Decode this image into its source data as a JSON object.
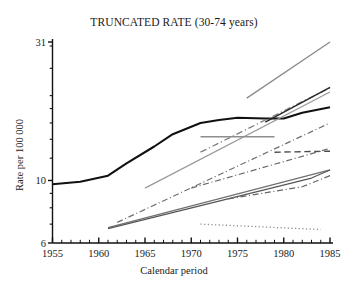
{
  "chart_data": {
    "type": "line",
    "title": "TRUNCATED RATE (30-74 years)",
    "xlabel": "Calendar period",
    "ylabel": "Rate per 100 000",
    "yscale": "log",
    "ylim": [
      6,
      31
    ],
    "xlim": [
      1955,
      1985
    ],
    "ytick_labels": [
      "31",
      "10",
      "6"
    ],
    "ytick_values": [
      31,
      10,
      6
    ],
    "xtick_labels": [
      "1955",
      "1960",
      "1965",
      "1970",
      "1975",
      "1980",
      "1985"
    ],
    "xtick_values": [
      1955,
      1960,
      1965,
      1970,
      1975,
      1980,
      1985
    ],
    "xminor_step": 1,
    "grid": false,
    "legend": "none",
    "series": [
      {
        "name": "series-1-thick-solid-black",
        "style": "solid",
        "color": "#111111",
        "width": 2.1,
        "x": [
          1955,
          1958,
          1961,
          1963,
          1966,
          1968,
          1971,
          1973,
          1975,
          1978,
          1980,
          1982,
          1985
        ],
        "y": [
          9.7,
          9.9,
          10.4,
          11.5,
          13.2,
          14.6,
          16.0,
          16.4,
          16.7,
          16.6,
          16.6,
          17.4,
          18.2
        ]
      },
      {
        "name": "series-2-steep-gray-solid",
        "style": "solid",
        "color": "#8a8a8a",
        "width": 1.3,
        "x": [
          1976,
          1985
        ],
        "y": [
          19.6,
          31.0
        ]
      },
      {
        "name": "series-3-gray-dashdot-rising",
        "style": "dashdot",
        "color": "#7d7d7d",
        "width": 1.3,
        "x": [
          1971,
          1985
        ],
        "y": [
          12.6,
          21.3
        ]
      },
      {
        "name": "series-4-gray-solid-rising",
        "style": "solid",
        "color": "#9a9a9a",
        "width": 1.3,
        "x": [
          1965,
          1985
        ],
        "y": [
          9.4,
          20.6
        ]
      },
      {
        "name": "series-5-black-solid-rising-right",
        "style": "solid",
        "color": "#2a2a2a",
        "width": 1.5,
        "x": [
          1978,
          1985
        ],
        "y": [
          16.1,
          21.4
        ]
      },
      {
        "name": "series-6-gray-horizontal",
        "style": "solid",
        "color": "#8e8e8e",
        "width": 1.5,
        "x": [
          1971,
          1979
        ],
        "y": [
          14.3,
          14.3
        ]
      },
      {
        "name": "series-7-dashdot-long-rise",
        "style": "dashdot",
        "color": "#6f6f6f",
        "width": 1.2,
        "x": [
          1962,
          1985
        ],
        "y": [
          7.1,
          16.0
        ]
      },
      {
        "name": "series-8-dashed-plateau",
        "style": "dashed",
        "color": "#4a4a4a",
        "width": 1.4,
        "x": [
          1979,
          1985
        ],
        "y": [
          12.6,
          12.7
        ]
      },
      {
        "name": "series-9-dashdot-mid-rise",
        "style": "dashdot",
        "color": "#6a6a6a",
        "width": 1.2,
        "x": [
          1970,
          1985
        ],
        "y": [
          9.4,
          13.0
        ]
      },
      {
        "name": "series-10-solid-low-rise",
        "style": "solid",
        "color": "#707070",
        "width": 1.2,
        "x": [
          1961,
          1985
        ],
        "y": [
          6.8,
          10.9
        ]
      },
      {
        "name": "series-11-solid-low-rise-b",
        "style": "solid",
        "color": "#555555",
        "width": 1.2,
        "x": [
          1961,
          1983,
          1985
        ],
        "y": [
          6.75,
          10.2,
          10.9
        ]
      },
      {
        "name": "series-12-dashdot-low",
        "style": "dashdot",
        "color": "#666666",
        "width": 1.2,
        "x": [
          1974,
          1982,
          1985
        ],
        "y": [
          8.6,
          9.5,
          10.4
        ]
      },
      {
        "name": "series-13-dotted-flat",
        "style": "dotted",
        "color": "#888888",
        "width": 1.3,
        "x": [
          1971,
          1984
        ],
        "y": [
          7.0,
          6.7
        ]
      }
    ]
  }
}
